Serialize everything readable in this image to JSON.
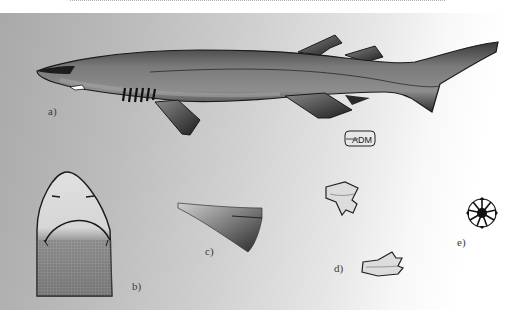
{
  "figure": {
    "panels": [
      {
        "id": "a",
        "label": "a)",
        "description": "lateral view of whole shark"
      },
      {
        "id": "b",
        "label": "b)",
        "description": "ventral view of head"
      },
      {
        "id": "c",
        "label": "c)",
        "description": "pectoral fin detail"
      },
      {
        "id": "d",
        "label": "d)",
        "description": "teeth"
      },
      {
        "id": "e",
        "label": "e)",
        "description": "dermal denticle"
      }
    ],
    "signature": "ADM"
  }
}
